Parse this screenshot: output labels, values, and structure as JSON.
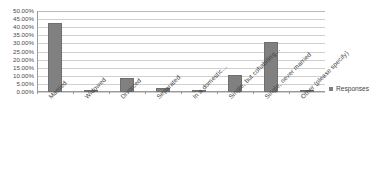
{
  "chart_data": {
    "type": "bar",
    "title": "",
    "xlabel": "",
    "ylabel": "",
    "ylim": [
      0,
      50
    ],
    "grid": true,
    "legend_position": "right",
    "value_suffix": "%",
    "categories": [
      "Married",
      "Widowed",
      "Divorced",
      "Separated",
      "In a domestic…",
      "Single, but cohabiting…",
      "Single, never married",
      "Other (please specify)"
    ],
    "series": [
      {
        "name": "Responses",
        "color": "#808080",
        "values": [
          42.5,
          1.0,
          8.5,
          2.3,
          1.0,
          10.5,
          31.0,
          0.3
        ]
      }
    ],
    "y_ticks": [
      "0.00%",
      "5.00%",
      "10.00%",
      "15.00%",
      "20.00%",
      "25.00%",
      "30.00%",
      "35.00%",
      "40.00%",
      "45.00%",
      "50.00%"
    ],
    "y_tick_values": [
      0,
      5,
      10,
      15,
      20,
      25,
      30,
      35,
      40,
      45,
      50
    ]
  },
  "legend": {
    "entries": [
      {
        "label": "Responses",
        "color": "#808080"
      }
    ]
  },
  "colors": {
    "bar": "#808080",
    "bar_border": "#6f6f6f",
    "gridline": "#cfcfcf",
    "axis": "#9a9a9a",
    "text": "#3f3f3f",
    "tick_text": "#4c4c4c",
    "background": "#ffffff"
  }
}
